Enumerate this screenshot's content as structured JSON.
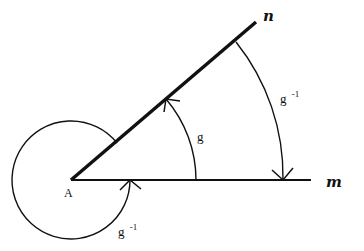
{
  "diagram": {
    "vertex": {
      "label": "A"
    },
    "lines": {
      "m": {
        "label": "m"
      },
      "n": {
        "label": "n"
      }
    },
    "angles": {
      "inner": {
        "label": "g",
        "direction": "m-to-n"
      },
      "outer": {
        "label": "g",
        "superscript": "-1",
        "direction": "n-to-m"
      },
      "reflex": {
        "label": "g",
        "superscript": "-1",
        "direction": "around-A"
      }
    },
    "colors": {
      "stroke": "#111111",
      "background": "#ffffff"
    }
  }
}
